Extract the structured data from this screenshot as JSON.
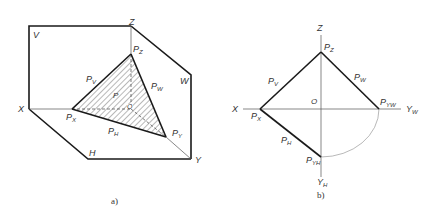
{
  "figure_a": {
    "caption": "a)",
    "plane_labels": {
      "V": "V",
      "W": "W",
      "H": "H"
    },
    "axis_labels": {
      "X": "X",
      "Y": "Y",
      "Z": "Z",
      "O": "O"
    },
    "plane_name": "P",
    "traces": {
      "PV": {
        "main": "P",
        "sub": "V"
      },
      "PW": {
        "main": "P",
        "sub": "W"
      },
      "PH": {
        "main": "P",
        "sub": "H"
      }
    },
    "points": {
      "PX": {
        "main": "P",
        "sub": "X"
      },
      "PY": {
        "main": "P",
        "sub": "Y"
      },
      "PZ": {
        "main": "P",
        "sub": "Z"
      }
    }
  },
  "figure_b": {
    "caption": "b)",
    "axis_labels": {
      "X": "X",
      "Z": "Z",
      "O": "O",
      "YW": {
        "main": "Y",
        "sub": "W"
      },
      "YH": {
        "main": "Y",
        "sub": "H"
      }
    },
    "traces": {
      "PV": {
        "main": "P",
        "sub": "V"
      },
      "PW": {
        "main": "P",
        "sub": "W"
      },
      "PH": {
        "main": "P",
        "sub": "H"
      }
    },
    "points": {
      "PX": {
        "main": "P",
        "sub": "X"
      },
      "PZ": {
        "main": "P",
        "sub": "Z"
      },
      "PYW": {
        "main": "P",
        "sub": "YW"
      },
      "PYH": {
        "main": "P",
        "sub": "YH"
      }
    }
  },
  "colors": {
    "line": "#1a1a1a",
    "thin_line": "#555555",
    "arc": "#999999",
    "text": "#333333",
    "background": "#ffffff"
  }
}
